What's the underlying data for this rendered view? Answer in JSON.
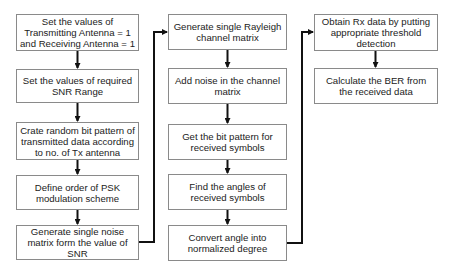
{
  "diagram": {
    "type": "flowchart",
    "columns": [
      {
        "steps": [
          {
            "text": "Set the values of Transmitting Antenna = 1 and Receiving Antenna = 1"
          },
          {
            "text": "Set the values of required SNR Range"
          },
          {
            "text": "Crate random bit pattern of transmitted data according to no. of Tx antenna"
          },
          {
            "text": "Define order of PSK modulation scheme"
          },
          {
            "text": "Generate single noise matrix form the value of SNR"
          }
        ]
      },
      {
        "steps": [
          {
            "text": "Generate single Rayleigh channel matrix"
          },
          {
            "text": "Add noise in the channel matrix"
          },
          {
            "text": "Get the bit pattern for received symbols"
          },
          {
            "text": "Find the angles of received symbols"
          },
          {
            "text": "Convert angle into normalized degree"
          }
        ]
      },
      {
        "steps": [
          {
            "text": "Obtain Rx data by putting appropriate threshold detection"
          },
          {
            "text": "Calculate the BER from the received data"
          }
        ]
      }
    ],
    "colors": {
      "box_border": "#8a8a8a",
      "arrow": "#111111",
      "text": "#222222"
    }
  }
}
